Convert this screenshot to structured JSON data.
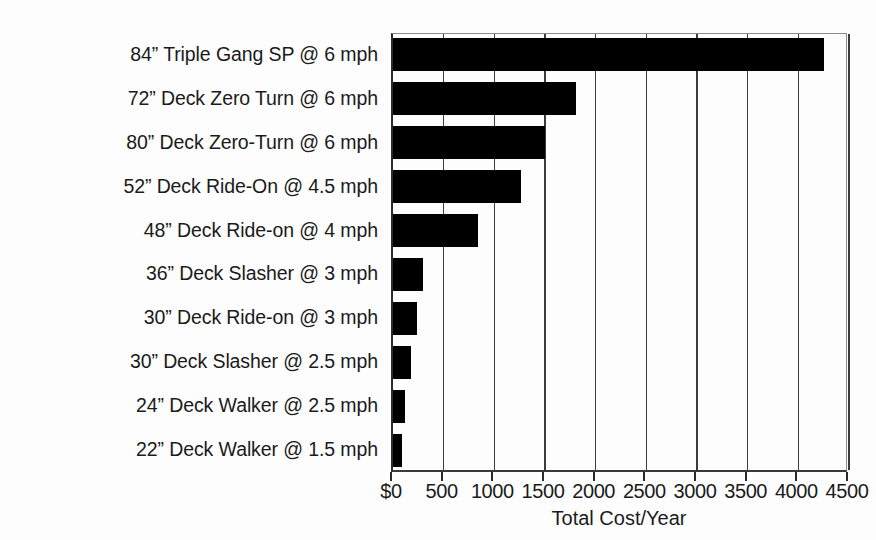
{
  "chart_data": {
    "type": "bar",
    "orientation": "horizontal",
    "title": "",
    "xlabel": "Total Cost/Year",
    "ylabel": "",
    "xlim": [
      0,
      4500
    ],
    "grid": true,
    "legend": false,
    "xticks": [
      "$0",
      "500",
      "1000",
      "1500",
      "2000",
      "2500",
      "3000",
      "3500",
      "4000",
      "4500"
    ],
    "xtick_values": [
      0,
      500,
      1000,
      1500,
      2000,
      2500,
      3000,
      3500,
      4000,
      4500
    ],
    "categories": [
      "84” Triple Gang SP @ 6 mph",
      "72” Deck Zero Turn @ 6 mph",
      "80” Deck Zero-Turn @ 6 mph",
      "52” Deck Ride-On @ 4.5 mph",
      "48” Deck Ride-on @ 4 mph",
      "36” Deck Slasher @ 3 mph",
      "30” Deck Ride-on @ 3 mph",
      "30” Deck Slasher @ 2.5 mph",
      "24” Deck Walker @ 2.5 mph",
      "22” Deck Walker @ 1.5 mph"
    ],
    "values": [
      4250,
      1810,
      1500,
      1260,
      840,
      295,
      240,
      180,
      120,
      85
    ],
    "bar_color": "#000000",
    "grid_color": "#3b3b3b",
    "axis_color": "#2a2a2a",
    "background_color": "#fdfdfd"
  }
}
